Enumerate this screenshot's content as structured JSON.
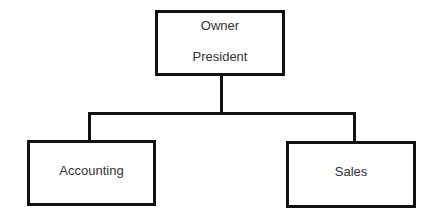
{
  "diagram": {
    "type": "org-chart",
    "root": {
      "lines": [
        "Owner",
        "President"
      ]
    },
    "children": [
      {
        "label": "Accounting"
      },
      {
        "label": "Sales"
      }
    ]
  }
}
